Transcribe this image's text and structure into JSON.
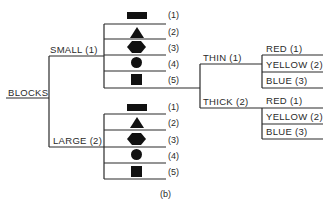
{
  "diagram": {
    "root": "BLOCKS",
    "caption": "(b)",
    "size_branches": [
      {
        "label": "SMALL (1)",
        "shapes": [
          {
            "icon": "bar-icon",
            "label": "(1)"
          },
          {
            "icon": "triangle-icon",
            "label": "(2)"
          },
          {
            "icon": "hexagon-icon",
            "label": "(3)"
          },
          {
            "icon": "circle-icon",
            "label": "(4)"
          },
          {
            "icon": "square-icon",
            "label": "(5)"
          }
        ]
      },
      {
        "label": "LARGE (2)",
        "shapes": [
          {
            "icon": "bar-icon",
            "label": "(1)"
          },
          {
            "icon": "triangle-icon",
            "label": "(2)"
          },
          {
            "icon": "hexagon-icon",
            "label": "(3)"
          },
          {
            "icon": "circle-icon",
            "label": "(4)"
          },
          {
            "icon": "square-icon",
            "label": "(5)"
          }
        ]
      }
    ],
    "thickness_branches": [
      {
        "label": "THIN (1)",
        "colors": [
          "RED (1)",
          "YELLOW (2)",
          "BLUE (3)"
        ]
      },
      {
        "label": "THICK (2)",
        "colors": [
          "RED (1)",
          "YELLOW (2)",
          "BLUE (3)"
        ]
      }
    ]
  }
}
